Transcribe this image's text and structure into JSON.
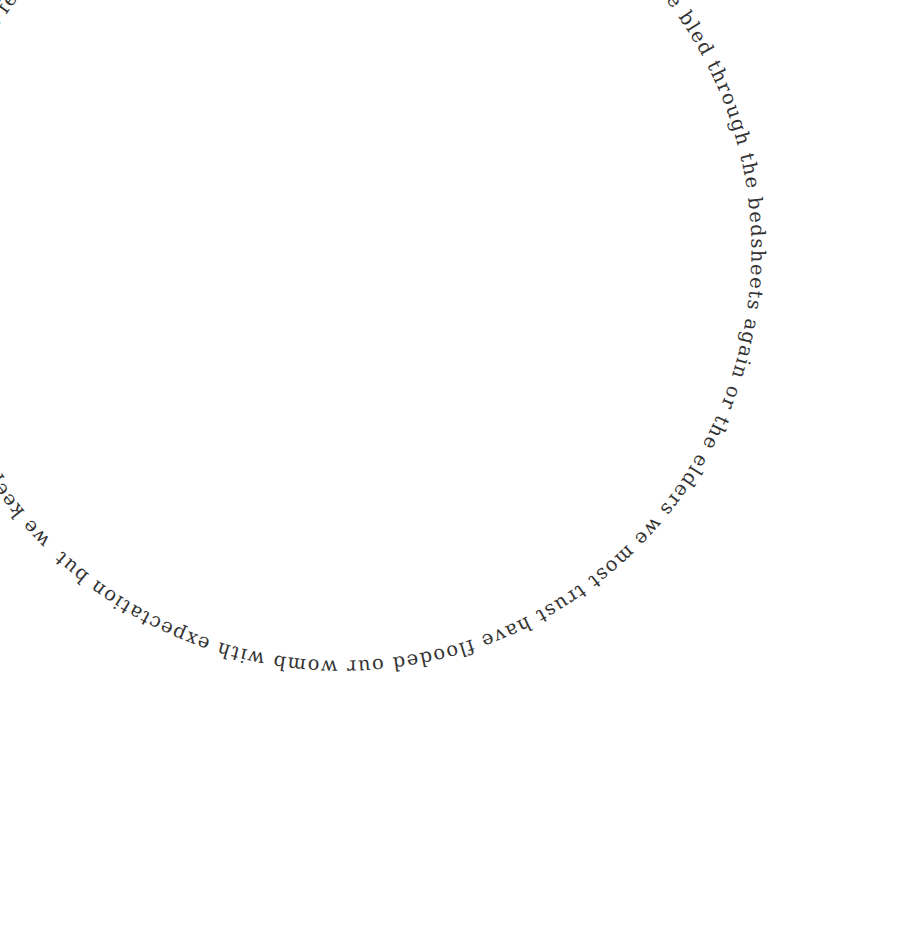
{
  "poem": {
    "text": "we keep praying the 91st psalm over the flat from fear or from memory we chastise ourselves about our shame we have bled through the bedsheets again or the elders we most trust have flooded our womb with expectation but",
    "layout": "circular",
    "color": "#333333"
  }
}
